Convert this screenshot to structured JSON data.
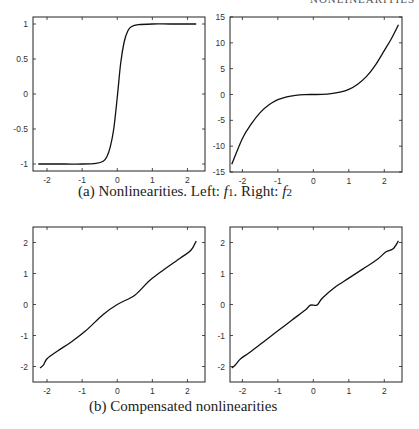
{
  "running_head": "NONLINEARITIES",
  "captions": {
    "a_prefix": "(a) Nonlinearities. Left: ",
    "a_f1": "f",
    "a_f1_sub": "1",
    "a_mid": ". Right: ",
    "a_f2": "f",
    "a_f2_sub": "2",
    "b": "(b) Compensated nonlinearities"
  },
  "chart_data": [
    {
      "id": "f1",
      "panel": "(a) left",
      "type": "line",
      "title": "f1",
      "xlabel": "",
      "ylabel": "",
      "xlim": [
        -2.4,
        2.5
      ],
      "ylim": [
        -1.1,
        1.1
      ],
      "xticks": [
        -2,
        -1,
        0,
        1,
        2
      ],
      "yticks": [
        -1,
        -0.5,
        0,
        0.5,
        1
      ],
      "ytick_labels": [
        "-1",
        "-0.5",
        "0",
        "0.5",
        "1"
      ],
      "grid": false,
      "x": [
        -2.25,
        -1.5,
        -1.0,
        -0.6,
        -0.4,
        -0.3,
        -0.2,
        -0.1,
        0.0,
        0.1,
        0.2,
        0.3,
        0.4,
        0.6,
        1.0,
        1.5,
        2.25
      ],
      "y": [
        -1.0,
        -1.0,
        -1.0,
        -0.99,
        -0.96,
        -0.9,
        -0.76,
        -0.5,
        -0.05,
        0.45,
        0.75,
        0.9,
        0.96,
        0.99,
        1.0,
        1.0,
        1.0
      ]
    },
    {
      "id": "f2",
      "panel": "(a) right",
      "type": "line",
      "title": "f2",
      "xlabel": "",
      "ylabel": "",
      "xlim": [
        -2.35,
        2.5
      ],
      "ylim": [
        -15,
        15
      ],
      "xticks": [
        -2,
        -1,
        0,
        1,
        2
      ],
      "yticks": [
        -15,
        -10,
        -5,
        0,
        5,
        10,
        15
      ],
      "ytick_labels": [
        "-15",
        "-10",
        "-5",
        "0",
        "5",
        "10",
        "15"
      ],
      "grid": false,
      "x": [
        -2.3,
        -2.0,
        -1.75,
        -1.5,
        -1.25,
        -1.0,
        -0.75,
        -0.5,
        -0.25,
        0.0,
        0.25,
        0.5,
        0.75,
        1.0,
        1.25,
        1.5,
        1.75,
        2.0,
        2.2,
        2.4
      ],
      "y": [
        -13.5,
        -8.5,
        -5.7,
        -3.5,
        -2.0,
        -1.0,
        -0.45,
        -0.15,
        -0.02,
        0.0,
        0.02,
        0.15,
        0.45,
        1.0,
        2.0,
        3.5,
        5.7,
        8.5,
        10.8,
        13.5
      ]
    },
    {
      "id": "comp1",
      "panel": "(b) left",
      "type": "line",
      "title": "Compensated f1",
      "xlabel": "",
      "ylabel": "",
      "xlim": [
        -2.4,
        2.5
      ],
      "ylim": [
        -2.5,
        2.5
      ],
      "xticks": [
        -2,
        -1,
        0,
        1,
        2
      ],
      "yticks": [
        -2,
        -1,
        0,
        1,
        2
      ],
      "ytick_labels": [
        "-2",
        "-1",
        "0",
        "1",
        "2"
      ],
      "grid": false,
      "x": [
        -2.2,
        -2.1,
        -2.0,
        -1.7,
        -1.3,
        -0.9,
        -0.4,
        0.0,
        0.5,
        0.9,
        1.3,
        1.8,
        2.1,
        2.25
      ],
      "y": [
        -2.05,
        -1.95,
        -1.75,
        -1.5,
        -1.2,
        -0.85,
        -0.32,
        0.0,
        0.3,
        0.75,
        1.1,
        1.5,
        1.75,
        2.05
      ]
    },
    {
      "id": "comp2",
      "panel": "(b) right",
      "type": "line",
      "title": "Compensated f2",
      "xlabel": "",
      "ylabel": "",
      "xlim": [
        -2.35,
        2.5
      ],
      "ylim": [
        -2.5,
        2.5
      ],
      "xticks": [
        -2,
        -1,
        0,
        1,
        2
      ],
      "yticks": [
        -2,
        -1,
        0,
        1,
        2
      ],
      "ytick_labels": [
        "-2",
        "-1",
        "0",
        "1",
        "2"
      ],
      "grid": false,
      "x": [
        -2.3,
        -2.2,
        -2.05,
        -1.8,
        -1.4,
        -1.0,
        -0.6,
        -0.2,
        -0.08,
        0.1,
        0.25,
        0.6,
        1.0,
        1.4,
        1.8,
        2.05,
        2.25,
        2.4
      ],
      "y": [
        -2.05,
        -1.95,
        -1.75,
        -1.55,
        -1.2,
        -0.85,
        -0.5,
        -0.15,
        -0.02,
        -0.02,
        0.2,
        0.55,
        0.85,
        1.15,
        1.45,
        1.7,
        1.8,
        2.05
      ]
    }
  ]
}
